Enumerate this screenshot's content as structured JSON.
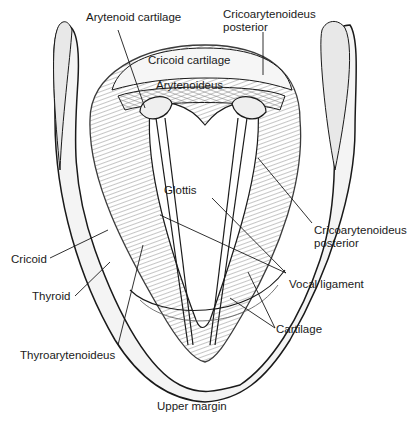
{
  "diagram": {
    "labels": {
      "arytenoid_cartilage": "Arytenoid cartilage",
      "cricoarytenoideus_posterior_top_1": "Cricoarytenoideus",
      "cricoarytenoideus_posterior_top_2": "posterior",
      "cricoid_cartilage": "Cricoid cartilage",
      "arytenoideus": "Arytenoideus",
      "glottis": "Glottis",
      "cricoarytenoideus_posterior_right_1": "Cricoarytenoideus",
      "cricoarytenoideus_posterior_right_2": "posterior",
      "cricoid": "Cricoid",
      "vocal_ligament": "Vocal ligament",
      "thyroid": "Thyroid",
      "cartilage": "Cartilage",
      "thyroarytenoideus": "Thyroarytenoideus",
      "upper_margin": "Upper margin"
    },
    "colors": {
      "ink": "#1a1a1a",
      "shade": "#8a8a8a",
      "light": "#d9d9d9",
      "background": "#ffffff"
    }
  }
}
